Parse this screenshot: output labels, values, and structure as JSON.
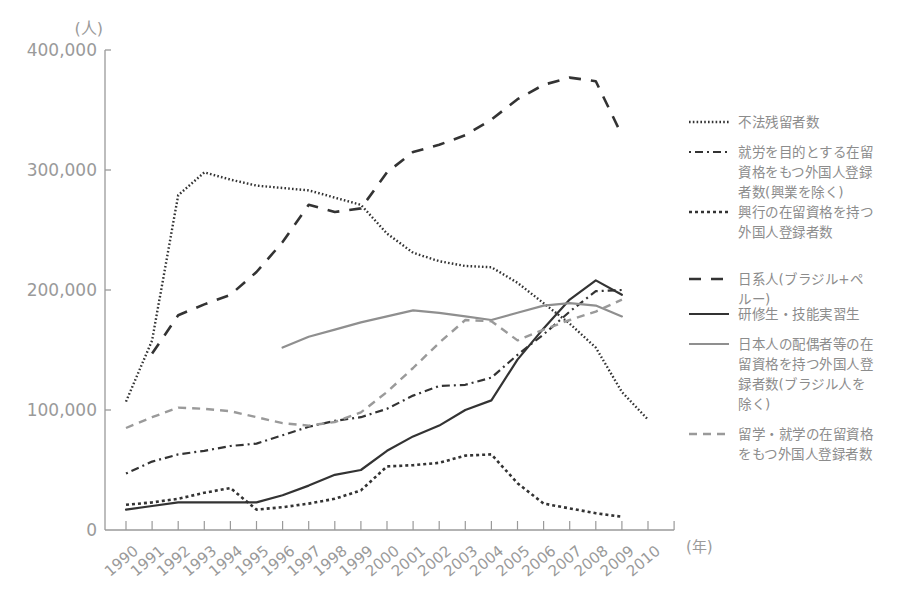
{
  "chart_data": {
    "type": "line",
    "title": "",
    "ylabel": "(人)",
    "xlabel": "(年)",
    "ylim": [
      0,
      400000
    ],
    "yticks": [
      0,
      100000,
      200000,
      300000,
      400000
    ],
    "ytick_labels": [
      "0",
      "100,000",
      "200,000",
      "300,000",
      "400,000"
    ],
    "grid": false,
    "legend_position": "right",
    "x": [
      1990,
      1991,
      1992,
      1993,
      1994,
      1995,
      1996,
      1997,
      1998,
      1999,
      2000,
      2001,
      2002,
      2003,
      2004,
      2005,
      2006,
      2007,
      2008,
      2009,
      2010
    ],
    "x_labels": [
      "1990",
      "1991",
      "1992",
      "1993",
      "1994",
      "1995",
      "1996",
      "1997",
      "1998",
      "1999",
      "2000",
      "2001",
      "2002",
      "2003",
      "2004",
      "2005",
      "2006",
      "2007",
      "2008",
      "2009",
      "2010"
    ],
    "series": [
      {
        "name": "不法残留者数",
        "style": "dotted-fine",
        "color": "#333333",
        "values": [
          107000,
          158000,
          279000,
          298000,
          292000,
          287000,
          285000,
          283000,
          277000,
          271000,
          247000,
          231000,
          224000,
          220000,
          219000,
          206000,
          189000,
          172000,
          152000,
          115000,
          92000
        ]
      },
      {
        "name": "就労を目的とする在留資格をもつ外国人登録者数(興業を除く)",
        "style": "dash-dot",
        "color": "#333333",
        "values": [
          47000,
          57000,
          63000,
          66000,
          70000,
          72000,
          79000,
          86000,
          91000,
          94000,
          101000,
          112000,
          120000,
          121000,
          127000,
          146000,
          163000,
          182000,
          199000,
          200000,
          null
        ]
      },
      {
        "name": "興行の在留資格を持つ外国人登録者数",
        "style": "dotted-coarse",
        "color": "#333333",
        "values": [
          21000,
          23000,
          26000,
          31000,
          35000,
          17000,
          19000,
          22000,
          26000,
          33000,
          53000,
          54000,
          56000,
          62000,
          63000,
          39000,
          22000,
          18000,
          14000,
          11000,
          null
        ]
      },
      {
        "name": "日系人(ブラジル+ペルー)",
        "style": "dashed-long",
        "color": "#333333",
        "values": [
          null,
          147000,
          179000,
          188000,
          196000,
          215000,
          240000,
          271000,
          265000,
          268000,
          298000,
          315000,
          321000,
          329000,
          342000,
          359000,
          371000,
          377000,
          374000,
          329000,
          null
        ]
      },
      {
        "name": "研修生・技能実習生",
        "style": "solid",
        "color": "#333333",
        "values": [
          17000,
          20000,
          23000,
          23000,
          23000,
          23000,
          29000,
          37000,
          46000,
          50000,
          66000,
          78000,
          87000,
          100000,
          108000,
          142000,
          168000,
          192000,
          208000,
          196000,
          null
        ]
      },
      {
        "name": "日本人の配偶者等の在留資格を持つ外国人登録者数(ブラジル人を除く)",
        "style": "solid",
        "color": "#8f8f8f",
        "values": [
          null,
          null,
          null,
          null,
          null,
          null,
          152000,
          161000,
          167000,
          173000,
          178000,
          183000,
          181000,
          178000,
          175000,
          181000,
          187000,
          189000,
          187000,
          178000,
          null
        ]
      },
      {
        "name": "留学・就学の在留資格をもつ外国人登録者数",
        "style": "dashed",
        "color": "#9a9a9a",
        "values": [
          85000,
          94000,
          102000,
          101000,
          99000,
          94000,
          89000,
          87000,
          90000,
          98000,
          115000,
          135000,
          156000,
          175000,
          174000,
          158000,
          167000,
          175000,
          182000,
          192000,
          null
        ]
      }
    ]
  },
  "axis": {
    "y_unit": "(人)",
    "x_unit": "(年)"
  },
  "legend": {
    "items": [
      {
        "lines": [
          "不法残留者数"
        ]
      },
      {
        "lines": [
          "就労を目的とする在留",
          "資格をもつ外国人登録",
          "者数(興業を除く)"
        ]
      },
      {
        "lines": [
          "興行の在留資格を持つ",
          "外国人登録者数"
        ]
      },
      {
        "lines": [
          "日系人(ブラジル+ペ",
          "ルー)"
        ]
      },
      {
        "lines": [
          "研修生・技能実習生"
        ]
      },
      {
        "lines": [
          "日本人の配偶者等の在",
          "留資格を持つ外国人登",
          "録者数(ブラジル人を",
          "除く)"
        ]
      },
      {
        "lines": [
          "留学・就学の在留資格",
          "をもつ外国人登録者数"
        ]
      }
    ]
  }
}
